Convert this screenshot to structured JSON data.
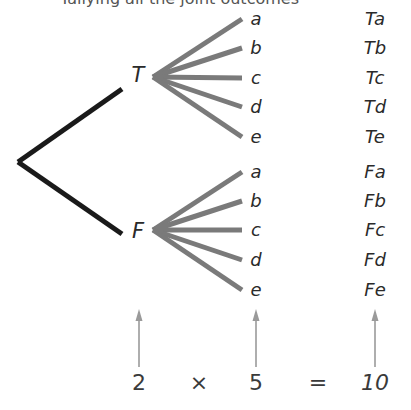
{
  "caption": "Tallying all the joint outcomes",
  "tree": {
    "root": {
      "x": 18,
      "y": 162
    },
    "first_stage": [
      {
        "label": "T",
        "line_end": {
          "x": 122,
          "y": 89
        },
        "label_pos": {
          "x": 138,
          "y": 82
        },
        "fan_origin": {
          "x": 153,
          "y": 77
        }
      },
      {
        "label": "F",
        "line_end": {
          "x": 122,
          "y": 234
        },
        "label_pos": {
          "x": 138,
          "y": 238
        },
        "fan_origin": {
          "x": 153,
          "y": 230
        }
      }
    ],
    "second_stage_labels": [
      "a",
      "b",
      "c",
      "d",
      "e"
    ],
    "branch_end_x": 242,
    "letter_x": 256,
    "outcome_x": 375,
    "group_y": [
      [
        19,
        48,
        78,
        107,
        137
      ],
      [
        172,
        201,
        230,
        260,
        290
      ]
    ],
    "outcomes": [
      [
        "Ta",
        "Tb",
        "Tc",
        "Td",
        "Te"
      ],
      [
        "Fa",
        "Fb",
        "Fc",
        "Fd",
        "Fe"
      ]
    ],
    "colors": {
      "first_stage": "#1a1a1a",
      "second_stage": "#7a7a7a",
      "arrow": "#9a9a9a"
    }
  },
  "equation": {
    "first": "2",
    "times": "×",
    "second": "5",
    "equals": "=",
    "result": "10"
  }
}
